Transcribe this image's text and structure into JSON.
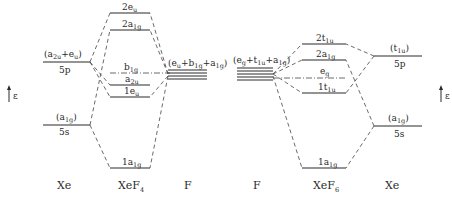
{
  "diagram": {
    "type": "molecular-orbital-energy-diagram",
    "energy_axis_label": "ε",
    "left": {
      "columns": [
        "Xe",
        "XeF4",
        "F"
      ],
      "column_labels": {
        "xe": "Xe",
        "mol_main": "XeF",
        "mol_sub": "4",
        "f": "F"
      },
      "xe_levels": [
        {
          "name": "5p",
          "sym_main": "(a",
          "sym_parts": "(a2u+eu)",
          "label": "5p"
        },
        {
          "name": "5s",
          "sym_parts": "(a1g)",
          "label": "5s"
        }
      ],
      "mo_levels": [
        {
          "main": "2e",
          "sub": "u"
        },
        {
          "main": "2a",
          "sub": "1g"
        },
        {
          "main": "b",
          "sub": "1g"
        },
        {
          "main": "a",
          "sub": "2u"
        },
        {
          "main": "1e",
          "sub": "u"
        },
        {
          "main": "1a",
          "sub": "1g"
        }
      ],
      "f_group_label": "(eu+b1g+a1g)"
    },
    "right": {
      "columns": [
        "F",
        "XeF6",
        "Xe"
      ],
      "column_labels": {
        "f": "F",
        "mol_main": "XeF",
        "mol_sub": "6",
        "xe": "Xe"
      },
      "xe_levels": [
        {
          "name": "5p",
          "sym_parts": "(t1u)",
          "label": "5p"
        },
        {
          "name": "5s",
          "sym_parts": "(a1g)",
          "label": "5s"
        }
      ],
      "mo_levels": [
        {
          "main": "2t",
          "sub": "1u"
        },
        {
          "main": "2a",
          "sub": "1g"
        },
        {
          "main": "e",
          "sub": "g"
        },
        {
          "main": "1t",
          "sub": "1u"
        },
        {
          "main": "1a",
          "sub": "1g"
        }
      ],
      "f_group_label": "(eg+t1u+a1g)"
    }
  }
}
